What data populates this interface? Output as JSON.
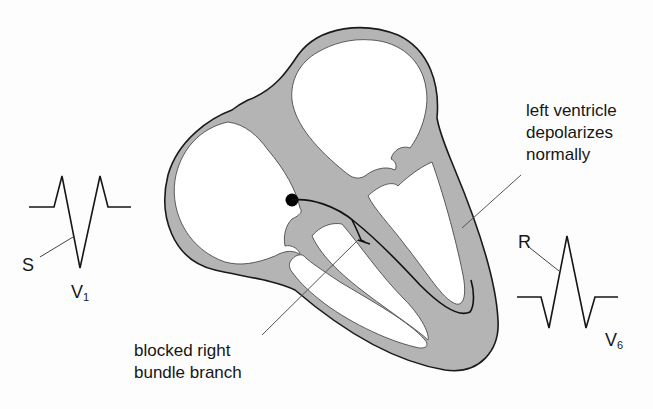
{
  "diagram": {
    "colors": {
      "myocardium_fill": "#b4b4b4",
      "outline": "#1a1a1a",
      "chamber_fill": "#ffffff",
      "leader_line": "#555555",
      "node_dot": "#000000"
    },
    "labels": {
      "left_ventricle": {
        "line1": "left ventricle",
        "line2": "depolarizes",
        "line3": "normally"
      },
      "blocked_branch": {
        "line1": "blocked right",
        "line2": "bundle branch"
      }
    },
    "leads": {
      "v1": {
        "name": "V",
        "subscript": "1",
        "wave_label": "S",
        "pattern": "rSR'"
      },
      "v6": {
        "name": "V",
        "subscript": "6",
        "wave_label": "R",
        "pattern": "qRS"
      }
    },
    "structures": [
      "right-atrium",
      "left-atrium",
      "right-ventricle",
      "left-ventricle",
      "interventricular-septum",
      "av-node",
      "left-bundle-branch",
      "blocked-right-bundle-branch"
    ]
  }
}
